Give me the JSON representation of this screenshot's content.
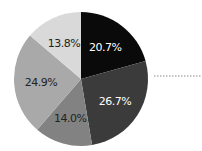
{
  "chart_data": {
    "type": "pie",
    "title": "",
    "categories": [
      "Slice 1",
      "Slice 2",
      "Slice 3",
      "Slice 4",
      "Slice 5"
    ],
    "values": [
      20.7,
      26.7,
      14.0,
      24.9,
      13.8
    ],
    "labels": [
      "20.7%",
      "26.7%",
      "14.0%",
      "24.9%",
      "13.8%"
    ],
    "colors": [
      "#0a0a0a",
      "#3b3b3b",
      "#828282",
      "#a9a9a9",
      "#d9d9d9"
    ],
    "label_colors": [
      "#ffffff",
      "#ffffff",
      "#222222",
      "#222222",
      "#222222"
    ],
    "start_angle": "12 o'clock",
    "direction": "clockwise",
    "legend": "none",
    "annotations": [
      "dotted leader line to the right of the pie"
    ]
  }
}
